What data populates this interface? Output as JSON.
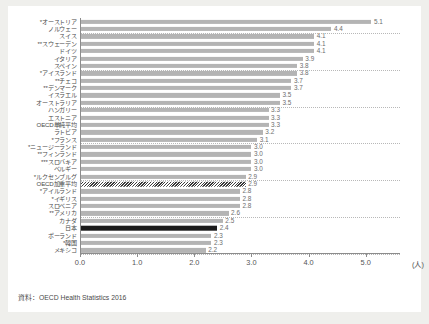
{
  "source_note": "資料：OECD Health Statistics 2016",
  "axis": {
    "unit": "(人)",
    "ticks": [
      "0.0",
      "1.0",
      "2.0",
      "3.0",
      "4.0",
      "5.0"
    ],
    "xmin": 0.0,
    "xmax": 5.6
  },
  "colors": {
    "bar": "#b4b4b4",
    "japan_bar": "#1c1c1c",
    "weighted_bar": "#3a3a3a",
    "axis": "#8c8c8c",
    "gridline": "#b8b8b8",
    "label": "#4a4a4a",
    "value": "#6d6d6d",
    "card": "#ffffff",
    "page": "#efefec"
  },
  "chart_data": {
    "type": "bar",
    "orientation": "horizontal",
    "title": "",
    "xlabel": "(人)",
    "ylabel": "",
    "xlim": [
      0.0,
      5.6
    ],
    "grid": true,
    "legend": "none",
    "categories": [
      "*オーストリア",
      "ノルウェー",
      "スイス",
      "**スウェーデン",
      "ドイツ",
      "イタリア",
      "スペイン",
      "*アイスランド",
      "**チェコ",
      "**デンマーク",
      "イスラエル",
      "オーストラリア",
      "ハンガリー",
      "エストニア",
      "OECD単純平均",
      "ラトビア",
      "*フランス",
      "*ニュージーランド",
      "**フィンランド",
      "***スロバキア",
      "ベルギー",
      "*ルクセンブルグ",
      "OECD加重平均",
      "*アイルランド",
      "*イギリス",
      "スロベニア",
      "**アメリカ",
      "カナダ",
      "日本",
      "ポーランド",
      "*韓国",
      "メキシコ"
    ],
    "values": [
      5.1,
      4.4,
      4.1,
      4.1,
      4.1,
      3.9,
      3.8,
      3.8,
      3.7,
      3.7,
      3.5,
      3.5,
      3.3,
      3.3,
      3.3,
      3.2,
      3.1,
      3.0,
      3.0,
      3.0,
      3.0,
      2.9,
      2.9,
      2.8,
      2.8,
      2.8,
      2.6,
      2.5,
      2.4,
      2.3,
      2.3,
      2.2
    ],
    "value_labels": [
      "5.1",
      "4.4",
      "4.1",
      "4.1",
      "4.1",
      "3.9",
      "3.8",
      "3.8",
      "3.7",
      "3.7",
      "3.5",
      "3.5",
      "3.3",
      "3.3",
      "3.3",
      "3.2",
      "3.1",
      "3.0",
      "3.0",
      "3.0",
      "3.0",
      "2.9",
      "2.9",
      "2.8",
      "2.8",
      "2.8",
      "2.6",
      "2.5",
      "2.4",
      "2.3",
      "2.3",
      "2.2"
    ],
    "highlight": {
      "japan_index": 28,
      "weighted_average_index": 22
    },
    "gridline_after_rows": [
      1,
      6,
      11,
      16,
      21,
      26,
      31
    ]
  }
}
